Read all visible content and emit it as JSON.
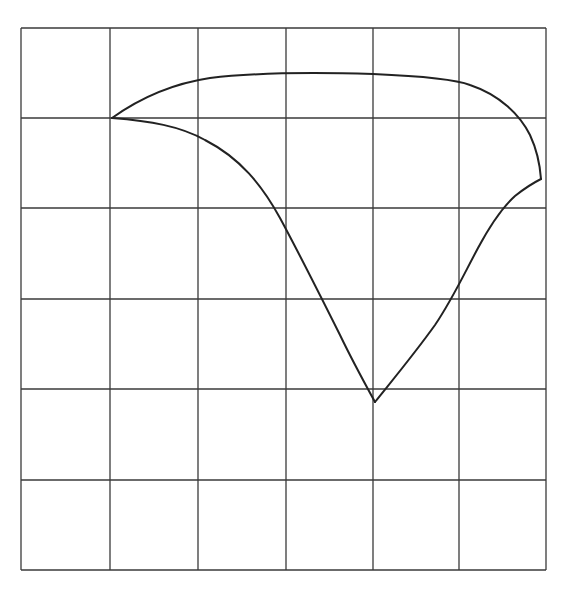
{
  "diagram": {
    "type": "curve-on-grid",
    "canvas": {
      "width": 564,
      "height": 595,
      "background": "#ffffff"
    },
    "grid": {
      "columns": 6,
      "rows": 6,
      "x_lines": [
        21,
        110,
        198,
        286,
        373,
        459,
        546
      ],
      "y_lines": [
        28,
        118,
        208,
        299,
        389,
        480,
        570
      ],
      "color": "#3a3a3a"
    },
    "curve_color": "#222222",
    "cusps": [
      {
        "name": "left-cusp",
        "x": 112,
        "y": 118
      },
      {
        "name": "right-cusp",
        "x": 541,
        "y": 179
      },
      {
        "name": "bottom-cusp",
        "x": 375,
        "y": 402
      }
    ],
    "segments": [
      {
        "name": "upper-arc",
        "path": "M112,118 C140,98 170,84 210,78 C250,73 300,72 373,74 C420,76 455,79 470,85 C500,95 520,115 530,135 C537,150 540,165 541,179"
      },
      {
        "name": "lower-left-arc",
        "path": "M112,118 C150,121 180,126 205,140 C240,158 262,185 280,218 C300,255 320,295 340,335 C352,360 364,382 375,402"
      },
      {
        "name": "lower-right-arc",
        "path": "M375,402 C395,377 415,353 435,325 C452,300 463,276 478,248 C492,222 505,205 515,196 C525,188 533,183 541,179"
      }
    ]
  }
}
